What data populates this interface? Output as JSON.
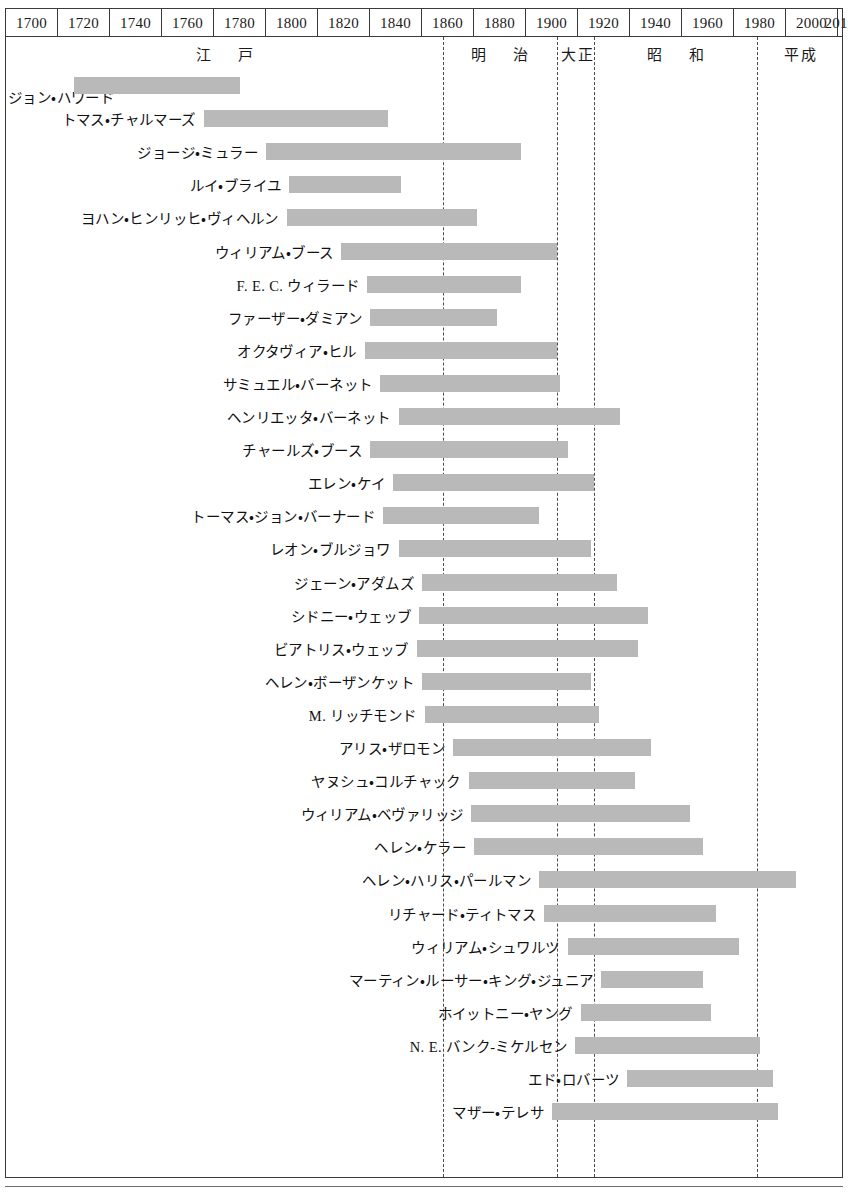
{
  "chart_data": {
    "type": "bar",
    "subtype": "timeline-gantt",
    "xlabel": "",
    "ylabel": "",
    "xlim": [
      1700,
      2020
    ],
    "grid": false,
    "axis": {
      "year_ticks": [
        "1700",
        "1720",
        "1740",
        "1760",
        "1780",
        "1800",
        "1820",
        "1840",
        "1860",
        "1880",
        "1900",
        "1920",
        "1940",
        "1960",
        "1980",
        "2000",
        "2010"
      ],
      "tick_step": 20,
      "last_tick_step": 10
    },
    "eras": [
      {
        "name": "江　戸",
        "start": 1700,
        "end": 1868
      },
      {
        "name": "明　治",
        "start": 1868,
        "end": 1912
      },
      {
        "name": "大正",
        "start": 1912,
        "end": 1926
      },
      {
        "name": "昭　和",
        "start": 1926,
        "end": 1989
      },
      {
        "name": "平成",
        "start": 1989,
        "end": 2020
      }
    ],
    "era_dividers": [
      1868,
      1912,
      1926,
      1989
    ],
    "bar_color": "#b9b9b9",
    "categories": [
      "ジョン・ハワード",
      "トマス・チャルマーズ",
      "ジョージ・ミュラー",
      "ルイ・ブライユ",
      "ヨハン・ヒンリッヒ・ヴィヘルン",
      "ウィリアム・ブース",
      "F. E. C. ウィラード",
      "ファーザー・ダミアン",
      "オクタヴィア・ヒル",
      "サミュエル・バーネット",
      "ヘンリエッタ・バーネット",
      "チャールズ・ブース",
      "エレン・ケイ",
      "トーマス・ジョン・バーナード",
      "レオン・ブルジョワ",
      "ジェーン・アダムズ",
      "シドニー・ウェッブ",
      "ビアトリス・ウェッブ",
      "ヘレン・ボーザンケット",
      "M. リッチモンド",
      "アリス・ザロモン",
      "ヤヌシュ・コルチャック",
      "ウィリアム・ベヴァリッジ",
      "ヘレン・ケラー",
      "ヘレン・ハリス・パールマン",
      "リチャード・ティトマス",
      "ウィリアム・シュワルツ",
      "マーティン・ルーサー・キング・ジュニア",
      "ホイットニー・ヤング",
      "N. E. バンク-ミケルセン",
      "エド・ロバーツ",
      "マザー・テレサ"
    ],
    "spans": [
      {
        "name": "ジョン・ハワード",
        "start": 1726,
        "end": 1790,
        "label_below": true
      },
      {
        "name": "トマス・チャルマーズ",
        "start": 1776,
        "end": 1847
      },
      {
        "name": "ジョージ・ミュラー",
        "start": 1800,
        "end": 1898
      },
      {
        "name": "ルイ・ブライユ",
        "start": 1809,
        "end": 1852
      },
      {
        "name": "ヨハン・ヒンリッヒ・ヴィヘルン",
        "start": 1808,
        "end": 1881
      },
      {
        "name": "ウィリアム・ブース",
        "start": 1829,
        "end": 1912
      },
      {
        "name": "F. E. C. ウィラード",
        "start": 1839,
        "end": 1898
      },
      {
        "name": "ファーザー・ダミアン",
        "start": 1840,
        "end": 1889
      },
      {
        "name": "オクタヴィア・ヒル",
        "start": 1838,
        "end": 1912
      },
      {
        "name": "サミュエル・バーネット",
        "start": 1844,
        "end": 1913
      },
      {
        "name": "ヘンリエッタ・バーネット",
        "start": 1851,
        "end": 1936
      },
      {
        "name": "チャールズ・ブース",
        "start": 1840,
        "end": 1916
      },
      {
        "name": "エレン・ケイ",
        "start": 1849,
        "end": 1926
      },
      {
        "name": "トーマス・ジョン・バーナード",
        "start": 1845,
        "end": 1905
      },
      {
        "name": "レオン・ブルジョワ",
        "start": 1851,
        "end": 1925
      },
      {
        "name": "ジェーン・アダムズ",
        "start": 1860,
        "end": 1935
      },
      {
        "name": "シドニー・ウェッブ",
        "start": 1859,
        "end": 1947
      },
      {
        "name": "ビアトリス・ウェッブ",
        "start": 1858,
        "end": 1943
      },
      {
        "name": "ヘレン・ボーザンケット",
        "start": 1860,
        "end": 1925
      },
      {
        "name": "M. リッチモンド",
        "start": 1861,
        "end": 1928
      },
      {
        "name": "アリス・ザロモン",
        "start": 1872,
        "end": 1948
      },
      {
        "name": "ヤヌシュ・コルチャック",
        "start": 1878,
        "end": 1942
      },
      {
        "name": "ウィリアム・ベヴァリッジ",
        "start": 1879,
        "end": 1963
      },
      {
        "name": "ヘレン・ケラー",
        "start": 1880,
        "end": 1968
      },
      {
        "name": "ヘレン・ハリス・パールマン",
        "start": 1905,
        "end": 2004
      },
      {
        "name": "リチャード・ティトマス",
        "start": 1907,
        "end": 1973
      },
      {
        "name": "ウィリアム・シュワルツ",
        "start": 1916,
        "end": 1982
      },
      {
        "name": "マーティン・ルーサー・キング・ジュニア",
        "start": 1929,
        "end": 1968
      },
      {
        "name": "ホイットニー・ヤング",
        "start": 1921,
        "end": 1971
      },
      {
        "name": "N. E. バンク-ミケルセン",
        "start": 1919,
        "end": 1990
      },
      {
        "name": "エド・ロバーツ",
        "start": 1939,
        "end": 1995
      },
      {
        "name": "マザー・テレサ",
        "start": 1910,
        "end": 1997
      }
    ]
  }
}
